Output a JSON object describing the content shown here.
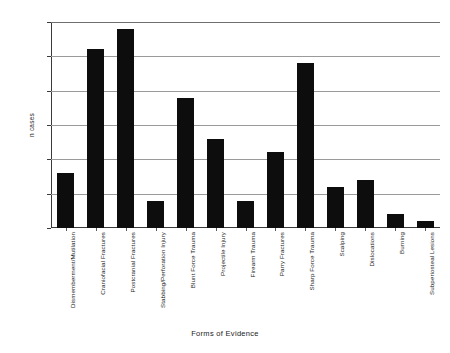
{
  "chart_data": {
    "type": "bar",
    "title": "",
    "xlabel": "Forms of Evidence",
    "ylabel": "n cases",
    "ylim": [
      0,
      30
    ],
    "yticks": [
      0,
      5,
      10,
      15,
      20,
      25,
      30
    ],
    "grid": true,
    "legend": false,
    "orientation": "vertical",
    "bar_color": "#0d0d0d",
    "categories": [
      "Dismemberment/Mutilation",
      "Craniofacial Fractures",
      "Postcranial Fractures",
      "Stabbing/Perforation Injury",
      "Blunt Force Trauma",
      "Projectile Injury",
      "Firearm Trauma",
      "Parry Fractures",
      "Sharp Force Trauma",
      "Scalping",
      "Dislocations",
      "Burning",
      "Subperiosteal Lesions"
    ],
    "values": [
      8,
      26,
      29,
      4,
      19,
      13,
      4,
      11,
      24,
      6,
      7,
      2,
      1
    ]
  }
}
